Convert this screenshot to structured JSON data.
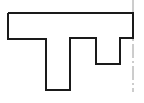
{
  "diagram": {
    "type": "profile-outline",
    "stroke_color": "#1a1a1a",
    "axis_color": "#9a9a9a",
    "background": "#ffffff",
    "outline_points": "8,13 133,13 133,38 120,38 120,64 96,64 96,38 70,38 70,90 46,90 46,39 8,39 8,13",
    "axis_line": {
      "x": 133,
      "y1": 0,
      "y2": 92
    }
  }
}
